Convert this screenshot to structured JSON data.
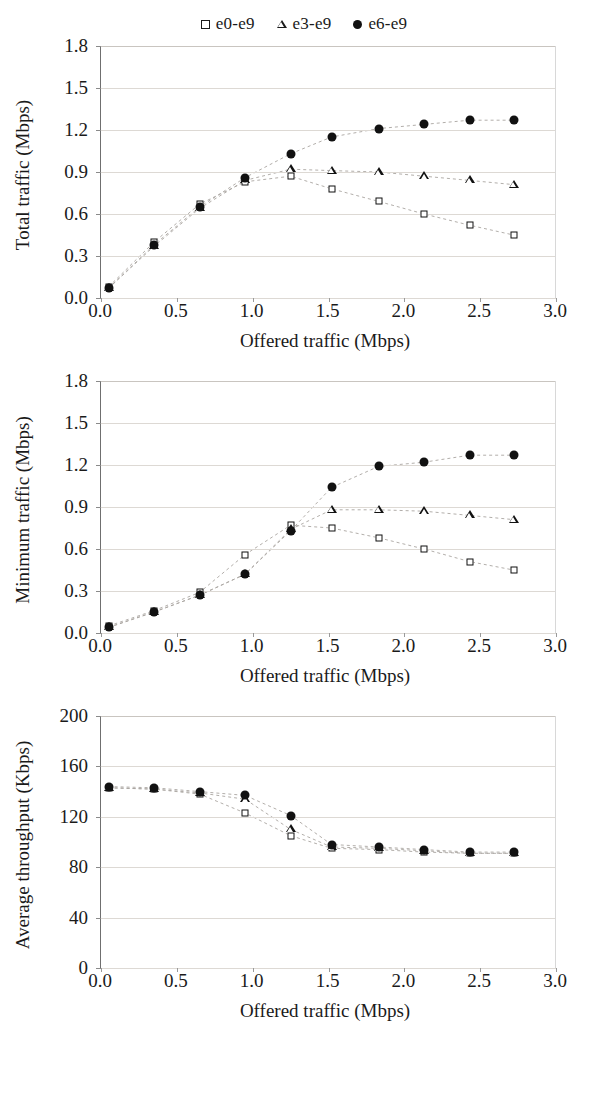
{
  "legend": {
    "entries": [
      {
        "label": "e0-e9",
        "marker": "square-marker"
      },
      {
        "label": "e3-e9",
        "marker": "triangle-marker"
      },
      {
        "label": "e6-e9",
        "marker": "circle-marker"
      }
    ]
  },
  "axis_title_x": "Offered traffic (Mbps)",
  "colors": {
    "marker": "#111111",
    "grid": "#ddd9d4",
    "axis": "#6f6f6f",
    "background": "#ffffff"
  },
  "chart_data": [
    {
      "type": "scatter",
      "title": "",
      "xlabel": "Offered traffic (Mbps)",
      "ylabel": "Total traffic (Mbps)",
      "xlim": [
        0.0,
        3.0
      ],
      "ylim": [
        0.0,
        1.8
      ],
      "xticks": [
        "0.0",
        "0.5",
        "1.0",
        "1.5",
        "2.0",
        "2.5",
        "3.0"
      ],
      "yticks": [
        "0.0",
        "0.3",
        "0.6",
        "0.9",
        "1.2",
        "1.5",
        "1.8"
      ],
      "grid": true,
      "legend_position": "top-center",
      "x": [
        0.05,
        0.35,
        0.65,
        0.95,
        1.25,
        1.52,
        1.83,
        2.13,
        2.43,
        2.72
      ],
      "series": [
        {
          "name": "e0-e9",
          "marker": "square",
          "values": [
            0.08,
            0.4,
            0.67,
            0.83,
            0.87,
            0.78,
            0.69,
            0.6,
            0.52,
            0.45
          ]
        },
        {
          "name": "e3-e9",
          "marker": "triangle",
          "values": [
            0.07,
            0.37,
            0.64,
            0.84,
            0.92,
            0.91,
            0.9,
            0.87,
            0.84,
            0.81
          ]
        },
        {
          "name": "e6-e9",
          "marker": "circle",
          "values": [
            0.07,
            0.38,
            0.65,
            0.86,
            1.03,
            1.15,
            1.21,
            1.24,
            1.27,
            1.27
          ]
        }
      ]
    },
    {
      "type": "scatter",
      "title": "",
      "xlabel": "Offered traffic (Mbps)",
      "ylabel": "Minimum traffic (Mbps)",
      "xlim": [
        0.0,
        3.0
      ],
      "ylim": [
        0.0,
        1.8
      ],
      "xticks": [
        "0.0",
        "0.5",
        "1.0",
        "1.5",
        "2.0",
        "2.5",
        "3.0"
      ],
      "yticks": [
        "0.0",
        "0.3",
        "0.6",
        "0.9",
        "1.2",
        "1.5",
        "1.8"
      ],
      "grid": true,
      "legend_position": "top-center",
      "x": [
        0.05,
        0.35,
        0.65,
        0.95,
        1.25,
        1.52,
        1.83,
        2.13,
        2.43,
        2.72
      ],
      "series": [
        {
          "name": "e0-e9",
          "marker": "square",
          "values": [
            0.05,
            0.16,
            0.29,
            0.56,
            0.77,
            0.75,
            0.68,
            0.6,
            0.51,
            0.45
          ]
        },
        {
          "name": "e3-e9",
          "marker": "triangle",
          "values": [
            0.04,
            0.15,
            0.27,
            0.42,
            0.74,
            0.88,
            0.88,
            0.87,
            0.84,
            0.81
          ]
        },
        {
          "name": "e6-e9",
          "marker": "circle",
          "values": [
            0.04,
            0.15,
            0.27,
            0.42,
            0.73,
            1.04,
            1.19,
            1.22,
            1.27,
            1.27
          ]
        }
      ]
    },
    {
      "type": "scatter",
      "title": "",
      "xlabel": "Offered traffic (Mbps)",
      "ylabel": "Average throughput (Kbps)",
      "xlim": [
        0.0,
        3.0
      ],
      "ylim": [
        0,
        200
      ],
      "xticks": [
        "0.0",
        "0.5",
        "1.0",
        "1.5",
        "2.0",
        "2.5",
        "3.0"
      ],
      "yticks": [
        "0",
        "40",
        "80",
        "120",
        "160",
        "200"
      ],
      "grid": true,
      "legend_position": "top-center",
      "x": [
        0.05,
        0.35,
        0.65,
        0.95,
        1.25,
        1.52,
        1.83,
        2.13,
        2.43,
        2.72
      ],
      "series": [
        {
          "name": "e0-e9",
          "marker": "square",
          "values": [
            143,
            142,
            138,
            123,
            105,
            95,
            94,
            92,
            91,
            91
          ]
        },
        {
          "name": "e3-e9",
          "marker": "triangle",
          "values": [
            143,
            142,
            139,
            134,
            110,
            96,
            95,
            93,
            91,
            91
          ]
        },
        {
          "name": "e6-e9",
          "marker": "circle",
          "values": [
            144,
            143,
            140,
            137,
            121,
            98,
            96,
            94,
            92,
            92
          ]
        }
      ]
    }
  ]
}
